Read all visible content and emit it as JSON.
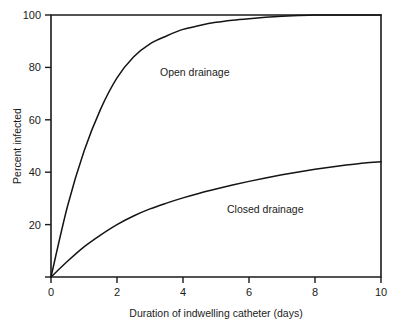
{
  "chart_data": {
    "type": "line",
    "title": "",
    "subtitle": "",
    "xlabel": "Duration of indwelling catheter (days)",
    "ylabel": "Percent infected",
    "xlim": [
      0,
      10
    ],
    "ylim": [
      0,
      100
    ],
    "xticks": [
      0,
      2,
      4,
      6,
      8,
      10
    ],
    "xtick_labels": [
      "0",
      "2",
      "4",
      "6",
      "8",
      "10"
    ],
    "yticks": [
      0,
      20,
      40,
      60,
      80,
      100
    ],
    "ytick_labels": [
      "0",
      "20",
      "40",
      "60",
      "80",
      "100"
    ],
    "grid": false,
    "legend_position": "inline-annotations",
    "x": [
      0,
      0.5,
      1,
      1.5,
      2,
      2.5,
      3,
      3.5,
      4,
      4.5,
      5,
      5.5,
      6,
      6.5,
      7,
      7.5,
      8,
      8.5,
      9,
      9.5,
      10
    ],
    "series": [
      {
        "name": "Open drainage",
        "label": "Open drainage",
        "label_x": 3.25,
        "label_y": 80,
        "color": "#141414",
        "values": [
          0,
          27,
          48,
          64,
          76,
          84,
          89,
          92,
          94.5,
          96,
          97.2,
          98,
          98.6,
          99.1,
          99.5,
          99.8,
          100,
          100,
          100,
          100,
          100
        ]
      },
      {
        "name": "Closed drainage",
        "label": "Closed drainage",
        "label_x": 5.9,
        "label_y": 25,
        "color": "#141414",
        "values": [
          0,
          6,
          11.5,
          16,
          20,
          23.3,
          26,
          28.2,
          30.2,
          32,
          33.6,
          35.1,
          36.5,
          37.8,
          39,
          40.1,
          41.1,
          42,
          42.8,
          43.5,
          44
        ]
      }
    ],
    "annotations": [
      {
        "text": "Open drainage",
        "x": 3.25,
        "y": 80
      },
      {
        "text": "Closed drainage",
        "x": 5.9,
        "y": 25
      }
    ]
  },
  "axes": {
    "y_axis_title": "Percent infected",
    "x_axis_title": "Duration of indwelling catheter (days)",
    "x_tick_0": "0",
    "x_tick_1": "2",
    "x_tick_2": "4",
    "x_tick_3": "6",
    "x_tick_4": "8",
    "x_tick_5": "10",
    "y_tick_0": "0",
    "y_tick_1": "20",
    "y_tick_2": "40",
    "y_tick_3": "60",
    "y_tick_4": "80",
    "y_tick_5": "100"
  },
  "labels": {
    "open_drainage": "Open drainage",
    "closed_drainage": "Closed drainage"
  },
  "colors": {
    "background": "#ffffff",
    "axis": "#1b1b1b",
    "curve": "#141414",
    "text": "#1a1a1a"
  }
}
